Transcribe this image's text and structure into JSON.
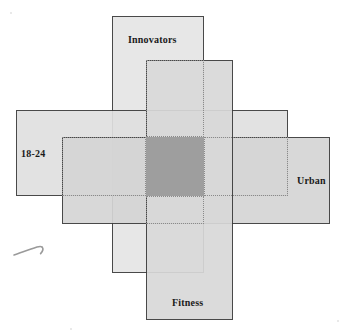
{
  "diagram": {
    "type": "proportional-rectangular-venn",
    "title": "",
    "sets": [
      {
        "id": "innovators",
        "label": "Innovators",
        "orientation": "vertical",
        "x": 112,
        "y": 16,
        "w": 92,
        "h": 257,
        "fill": "#e6e6e6",
        "stroke": "#3a3a3a",
        "label_x": 128,
        "label_y": 34
      },
      {
        "id": "age-18-24",
        "label": "18-24",
        "orientation": "horizontal",
        "x": 16,
        "y": 110,
        "w": 272,
        "h": 86,
        "fill": "#e0e0e0",
        "stroke": "#3a3a3a",
        "label_x": 21,
        "label_y": 148
      },
      {
        "id": "urban",
        "label": "Urban",
        "orientation": "horizontal",
        "x": 62,
        "y": 137,
        "w": 268,
        "h": 87,
        "fill": "#d5d5d5",
        "stroke": "#3a3a3a",
        "label_x": 297,
        "label_y": 175
      },
      {
        "id": "fitness",
        "label": "Fitness",
        "orientation": "vertical",
        "x": 146,
        "y": 60,
        "w": 87,
        "h": 260,
        "fill": "#d9d9d9",
        "stroke": "#3a3a3a",
        "label_x": 172,
        "label_y": 297
      }
    ],
    "intersection": {
      "id": "all-four-overlap",
      "x": 146,
      "y": 137,
      "w": 58,
      "h": 59,
      "fill": "#9e9e9e",
      "label": ""
    },
    "guides": [
      {
        "id": "guide-inner-upper",
        "x": 146,
        "y": 60,
        "w": 58,
        "h": 77
      },
      {
        "id": "guide-inner-left",
        "x": 62,
        "y": 137,
        "w": 84,
        "h": 59
      },
      {
        "id": "guide-inner-right",
        "x": 204,
        "y": 137,
        "w": 84,
        "h": 59
      },
      {
        "id": "guide-inner-lower",
        "x": 146,
        "y": 196,
        "w": 58,
        "h": 28
      }
    ],
    "annotation": {
      "id": "hand-drawn-arrow",
      "label": "",
      "x": 12,
      "y": 240
    },
    "colors": {
      "fill_light": "#e6e6e6",
      "fill_mid": "#d9d9d9",
      "fill_dark": "#9e9e9e",
      "stroke": "#3a3a3a",
      "guide": "#8a8a8a",
      "background": "#ffffff",
      "text": "#1a1a1a"
    }
  }
}
